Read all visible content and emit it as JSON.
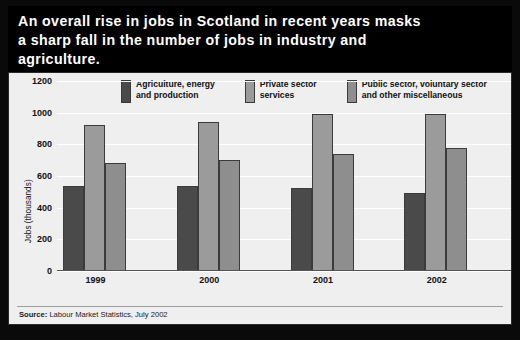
{
  "title": {
    "line1": "An overall rise in jobs in Scotland in recent years masks",
    "line2": "a sharp fall in the number of jobs in industry and",
    "line3": "agriculture."
  },
  "source": {
    "prefix": "Source:",
    "text": " Labour Market Statistics, July 2002"
  },
  "colors": {
    "series1": "#4a4a4a",
    "series2": "#9b9b9b",
    "series3": "#8e8e8e",
    "panel_background": "#efefef",
    "title_background": "#000000",
    "gridline": "#ffffff"
  },
  "chart_data": {
    "type": "bar",
    "title": "An overall rise in jobs in Scotland in recent years masks a sharp fall in the number of jobs in industry and agriculture.",
    "xlabel": "",
    "ylabel": "Jobs (thousands)",
    "ylim": [
      0,
      1200
    ],
    "yticks": [
      0,
      200,
      400,
      600,
      800,
      1000,
      1200
    ],
    "ytick_labels": [
      "0",
      "200",
      "400",
      "600",
      "800",
      "1000",
      "1200"
    ],
    "grid": true,
    "legend_position": "top",
    "categories": [
      "1999",
      "2000",
      "2001",
      "2002"
    ],
    "series": [
      {
        "name": "Agriculture, energy and production",
        "label_line1": "Agriculture, energy",
        "label_line2": "and production",
        "color": "#4a4a4a",
        "values": [
          540,
          535,
          525,
          495
        ]
      },
      {
        "name": "Private sector services",
        "label_line1": "Private sector",
        "label_line2": "services",
        "color": "#9b9b9b",
        "values": [
          925,
          940,
          990,
          990
        ]
      },
      {
        "name": "Public sector, voluntary sector and other miscellaneous",
        "label_line1": "Public sector, voluntary sector",
        "label_line2": "and other miscellaneous",
        "color": "#8e8e8e",
        "values": [
          680,
          700,
          740,
          775
        ]
      }
    ]
  }
}
